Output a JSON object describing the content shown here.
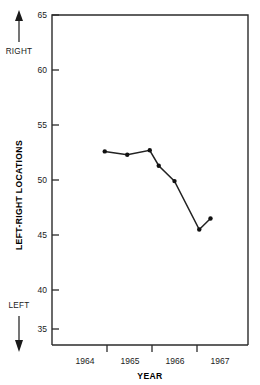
{
  "chart_data": {
    "type": "line",
    "title": "",
    "xlabel": "YEAR",
    "ylabel": "LEFT-RIGHT LOCATIONS",
    "xlim": [
      1963.75,
      1967.0
    ],
    "ylim": [
      33.0,
      65.0
    ],
    "yticks": [
      35,
      40,
      45,
      50,
      55,
      60,
      65
    ],
    "ytick_labels": [
      "35",
      "40",
      "45",
      "50",
      "55",
      "60",
      "65"
    ],
    "xticks": [
      1964,
      1965,
      1966,
      1967
    ],
    "xtick_labels": [
      "1964",
      "1965",
      "1966",
      "1967"
    ],
    "grid": false,
    "legend": false,
    "x": [
      1963.95,
      1964.45,
      1964.95,
      1965.15,
      1965.5,
      1966.05,
      1966.3
    ],
    "values": [
      52.6,
      52.3,
      52.7,
      51.3,
      49.9,
      45.5,
      46.5
    ],
    "series": [
      {
        "name": "Left-right locations",
        "values": [
          52.6,
          52.3,
          52.7,
          51.3,
          49.9,
          45.5,
          46.5
        ]
      }
    ],
    "annotations": [
      {
        "text": "RIGHT",
        "position": "upper-left-outside",
        "arrow": "up"
      },
      {
        "text": "LEFT",
        "position": "lower-left-outside",
        "arrow": "down"
      }
    ]
  },
  "axes": {
    "y_axis_title": "LEFT-RIGHT LOCATIONS",
    "x_axis_title": "YEAR",
    "y_tick_labels": [
      "65",
      "60",
      "55",
      "50",
      "45",
      "40",
      "35"
    ],
    "x_tick_labels": [
      "1964",
      "1965",
      "1966",
      "1967"
    ]
  },
  "direction_markers": {
    "up_label": "RIGHT",
    "down_label": "LEFT"
  },
  "colors": {
    "line": "#222222",
    "marker": "#111111",
    "axis": "#2b2b2b",
    "text": "#1a1a1a",
    "background": "#ffffff"
  }
}
